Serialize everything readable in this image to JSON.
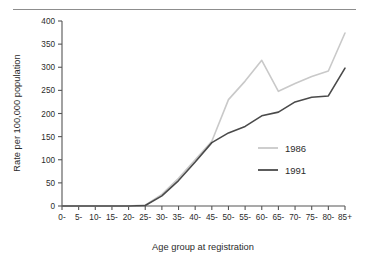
{
  "chart_data": {
    "type": "line",
    "title": "",
    "subtitle": "",
    "xlabel": "Age group at registration",
    "ylabel": "Rate per 100,000 population",
    "xlim": [
      0,
      17
    ],
    "ylim": [
      0,
      400
    ],
    "yticks": [
      0,
      50,
      100,
      150,
      200,
      250,
      300,
      350,
      400
    ],
    "ytick_labels": [
      "0",
      "50",
      "100",
      "150",
      "200",
      "250",
      "300",
      "350",
      "400"
    ],
    "categories": [
      "0-",
      "5-",
      "10-",
      "15-",
      "20-",
      "25-",
      "30-",
      "35-",
      "40-",
      "45-",
      "50-",
      "55-",
      "60-",
      "65-",
      "70-",
      "75-",
      "80-",
      "85+"
    ],
    "grid": false,
    "legend_position": "right-middle",
    "series": [
      {
        "name": "1986",
        "color": "#c9c9c9",
        "values": [
          0,
          0,
          0,
          0,
          0,
          2,
          25,
          60,
          100,
          140,
          230,
          270,
          315,
          248,
          265,
          280,
          292,
          374
        ]
      },
      {
        "name": "1991",
        "color": "#4a4a4a",
        "values": [
          0,
          0,
          0,
          0,
          0,
          1,
          22,
          55,
          95,
          137,
          158,
          172,
          195,
          203,
          225,
          235,
          238,
          298
        ]
      }
    ]
  },
  "legend": {
    "entries": [
      {
        "label": "1986",
        "color": "#c9c9c9"
      },
      {
        "label": "1991",
        "color": "#4a4a4a"
      }
    ]
  },
  "axes": {
    "y_title": "Rate per 100,000 population",
    "x_title": "Age group at registration"
  },
  "decoration": {
    "top_rule": "horizontal-rule"
  }
}
